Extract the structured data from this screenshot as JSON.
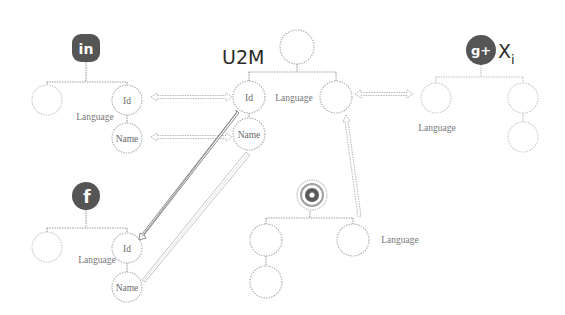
{
  "diagram": {
    "title": "U2M",
    "center_tree": {
      "label": "U2M",
      "nodes": [
        {
          "id": "root",
          "label": ""
        },
        {
          "id": "id",
          "label": "Id"
        },
        {
          "id": "right",
          "label": ""
        },
        {
          "id": "name",
          "label": "Name"
        }
      ],
      "edge_labels": {
        "language": "Language"
      }
    },
    "linkedin_tree": {
      "icon": "linkedin-icon",
      "icon_glyph": "in",
      "nodes": [
        {
          "id": "left",
          "label": ""
        },
        {
          "id": "id",
          "label": "Id"
        },
        {
          "id": "name",
          "label": "Name"
        }
      ],
      "edge_labels": {
        "language": "Language"
      }
    },
    "facebook_tree": {
      "icon": "facebook-icon",
      "icon_glyph": "f",
      "nodes": [
        {
          "id": "left",
          "label": ""
        },
        {
          "id": "id",
          "label": "Id"
        },
        {
          "id": "name",
          "label": "Name"
        }
      ],
      "edge_labels": {
        "language": "Language"
      }
    },
    "googleplus_tree": {
      "icon": "google-plus-icon",
      "icon_glyph": "g+",
      "label_main": "X",
      "label_sub": "i",
      "nodes": [
        {
          "id": "left",
          "label": ""
        },
        {
          "id": "right",
          "label": ""
        },
        {
          "id": "right-child",
          "label": ""
        }
      ],
      "edge_labels": {
        "language": "Language"
      }
    },
    "instagram_tree": {
      "icon": "instagram-icon",
      "nodes": [
        {
          "id": "left",
          "label": ""
        },
        {
          "id": "left-child",
          "label": ""
        },
        {
          "id": "right",
          "label": ""
        }
      ],
      "edge_labels": {
        "language": "Language"
      }
    },
    "mappings": [
      {
        "from": "linkedin.id",
        "to": "u2m.id",
        "style": "double-headed dotted"
      },
      {
        "from": "linkedin.name",
        "to": "u2m.name",
        "style": "double-headed dotted"
      },
      {
        "from": "googleplus.left",
        "to": "u2m.right",
        "style": "double-headed dotted"
      },
      {
        "from": "instagram.right",
        "to": "u2m.right",
        "style": "dotted arrow"
      },
      {
        "from": "u2m.id",
        "to": "facebook.id",
        "style": "dark double line"
      },
      {
        "from": "u2m.name",
        "to": "facebook.name",
        "style": "light double line"
      }
    ]
  }
}
